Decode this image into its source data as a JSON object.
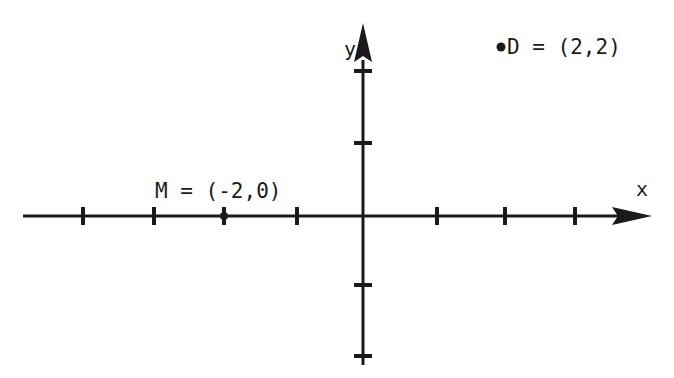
{
  "diagram": {
    "type": "coordinate-plane",
    "axes": {
      "x_label": "x",
      "y_label": "y"
    },
    "points": [
      {
        "name": "D",
        "label": "D = (2,2)",
        "x": 2,
        "y": 2,
        "marked": true
      },
      {
        "name": "M",
        "label": "M = (-2,0)",
        "x": -2,
        "y": 0,
        "marked": true
      }
    ],
    "ticks": {
      "x": [
        -4,
        -3,
        -2,
        -1,
        1,
        2,
        3
      ],
      "y": [
        -2,
        -1,
        1,
        2
      ]
    },
    "colors": {
      "ink": "#1a1a1a",
      "background": "#ffffff"
    }
  }
}
